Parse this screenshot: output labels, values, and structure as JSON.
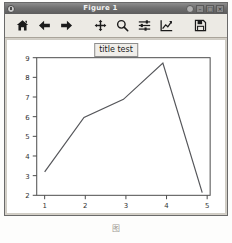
{
  "window": {
    "title": "Figure 1",
    "icon": "app-icon",
    "controls": [
      {
        "name": "window-menu-dot",
        "label": ""
      },
      {
        "name": "minimize-button",
        "label": "–"
      },
      {
        "name": "maximize-button",
        "label": "□"
      },
      {
        "name": "close-button",
        "label": "×"
      }
    ]
  },
  "toolbar": {
    "buttons": [
      {
        "name": "home-button",
        "icon": "home-icon",
        "label": "Home"
      },
      {
        "name": "back-button",
        "icon": "arrow-left-icon",
        "label": "Back"
      },
      {
        "name": "forward-button",
        "icon": "arrow-right-icon",
        "label": "Forward"
      },
      {
        "name": "pan-button",
        "icon": "move-cross-icon",
        "label": "Pan"
      },
      {
        "name": "zoom-button",
        "icon": "magnifier-icon",
        "label": "Zoom"
      },
      {
        "name": "configure-subplots-button",
        "icon": "sliders-icon",
        "label": "Configure subplots"
      },
      {
        "name": "edit-axis-button",
        "icon": "line-chart-icon",
        "label": "Edit axis, curve and image parameters"
      },
      {
        "name": "save-button",
        "icon": "floppy-disk-icon",
        "label": "Save the figure"
      }
    ]
  },
  "chart_data": {
    "type": "line",
    "title": "title test",
    "xlabel": "",
    "ylabel": "",
    "x": [
      1,
      2,
      3,
      4,
      5
    ],
    "values": [
      3,
      6,
      7,
      9,
      1.85
    ],
    "series": [
      {
        "name": "series-1",
        "values": [
          3,
          6,
          7,
          9,
          1.85
        ]
      }
    ],
    "xlim": [
      0.8,
      5.2
    ],
    "ylim": [
      1.7,
      9.3
    ],
    "xticks": [
      1,
      2,
      3,
      4,
      5
    ],
    "yticks": [
      2,
      3,
      4,
      5,
      6,
      7,
      8,
      9
    ],
    "xticklabels": [
      "1",
      "2",
      "3",
      "4",
      "5"
    ],
    "yticklabels": [
      "2",
      "3",
      "4",
      "5",
      "6",
      "7",
      "8",
      "9"
    ],
    "grid": false,
    "legend": null,
    "line_color": "#55565a",
    "marker": "none"
  },
  "background_text": [
    {
      "text": "使用工具栏"
    },
    {
      "text": "绘图调整显示"
    }
  ],
  "caption": {
    "figure_label": "图",
    "figure_number": "",
    "text": ""
  }
}
